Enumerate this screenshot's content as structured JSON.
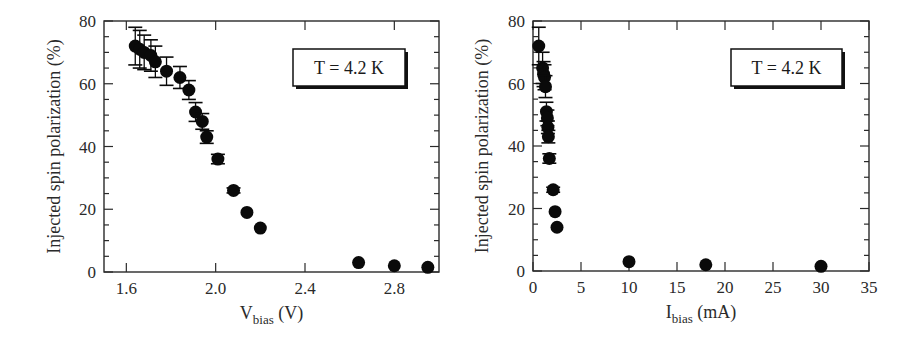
{
  "chart_data": [
    {
      "type": "scatter",
      "title": "",
      "xlabel": "V_bias (V)",
      "xlabel_main": "V",
      "xlabel_sub": "bias",
      "xlabel_unit": " (V)",
      "ylabel": "Injected spin polarization (%)",
      "xlim": [
        1.5,
        3.0
      ],
      "ylim": [
        0,
        80
      ],
      "xticks": [
        1.6,
        2.0,
        2.4,
        2.8
      ],
      "xtick_labels": [
        "1.6",
        "2.0",
        "2.4",
        "2.8"
      ],
      "yticks": [
        0,
        20,
        40,
        60,
        80
      ],
      "ytick_labels": [
        "0",
        "20",
        "40",
        "60",
        "80"
      ],
      "grid": false,
      "legend": {
        "text": "T = 4.2 K",
        "position": "upper right"
      },
      "series": [
        {
          "name": "T = 4.2 K",
          "marker": "filled-circle",
          "x": [
            1.64,
            1.66,
            1.68,
            1.71,
            1.73,
            1.78,
            1.84,
            1.88,
            1.91,
            1.94,
            1.96,
            2.01,
            2.08,
            2.14,
            2.2,
            2.64,
            2.8,
            2.95
          ],
          "y": [
            72,
            71,
            70,
            69,
            67,
            64,
            62,
            58,
            51,
            48,
            43,
            36,
            26,
            19,
            14,
            3,
            2,
            1.5
          ],
          "yerr": [
            6,
            6,
            5.5,
            5,
            5,
            4.5,
            3.5,
            3,
            3,
            2.5,
            2,
            1.5,
            0.8,
            0.5,
            0.5,
            0.5,
            0.5,
            0.5
          ]
        }
      ]
    },
    {
      "type": "scatter",
      "title": "",
      "xlabel": "I_bias (mA)",
      "xlabel_main": "I",
      "xlabel_sub": "bias",
      "xlabel_unit": " (mA)",
      "ylabel": "Injected spin polarization (%)",
      "xlim": [
        0,
        35
      ],
      "ylim": [
        0,
        80
      ],
      "xticks": [
        0,
        5,
        10,
        15,
        20,
        25,
        30,
        35
      ],
      "xtick_labels": [
        "0",
        "5",
        "10",
        "15",
        "20",
        "25",
        "30",
        "35"
      ],
      "yticks": [
        0,
        20,
        40,
        60,
        80
      ],
      "ytick_labels": [
        "0",
        "20",
        "40",
        "60",
        "80"
      ],
      "grid": false,
      "legend": {
        "text": "T = 4.2 K",
        "position": "upper right"
      },
      "series": [
        {
          "name": "T = 4.2 K",
          "marker": "filled-circle",
          "x": [
            0.6,
            1.0,
            1.1,
            1.2,
            1.3,
            1.4,
            1.5,
            1.55,
            1.6,
            1.7,
            2.1,
            2.3,
            2.5,
            10,
            18,
            30
          ],
          "y": [
            72,
            65,
            63,
            62,
            59,
            51,
            49,
            46,
            43,
            36,
            26,
            19,
            14,
            3,
            2,
            1.5
          ],
          "yerr": [
            6,
            5,
            4,
            4,
            3.5,
            3,
            2.5,
            2,
            2,
            1.5,
            0.8,
            0.5,
            0.5,
            0.5,
            0.5,
            0.5
          ]
        }
      ]
    }
  ],
  "colors": {
    "marker": "#0a0a0a",
    "axis": "#2a2a2a",
    "background": "#ffffff"
  }
}
